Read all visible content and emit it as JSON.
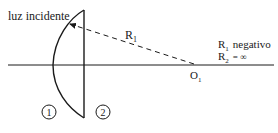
{
  "labels": {
    "incident_light": "luz incidente",
    "radius_line": "R",
    "radius_line_sub": "1",
    "r1_sign": "R",
    "r1_sign_sub": "1",
    "r1_sign_text": "negativo",
    "r2_value": "R",
    "r2_value_sub": "2",
    "r2_value_text": "= ∞",
    "center_point": "O",
    "center_point_sub": "1",
    "surface_1": "1",
    "surface_2": "2"
  },
  "colors": {
    "stroke": "#1a1a1a",
    "background": "#ffffff"
  }
}
